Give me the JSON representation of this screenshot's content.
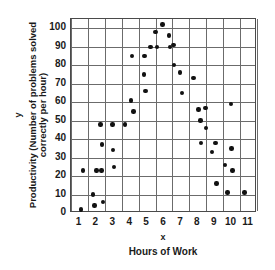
{
  "chart_data": {
    "type": "scatter",
    "title": "",
    "xlabel": "Hours of Work",
    "ylabel": "Productivity (Number of problems solved correctly per hour)",
    "x_axis_variable": "x",
    "y_axis_variable": "y",
    "xlim": [
      0.5,
      11.5
    ],
    "ylim": [
      0,
      105
    ],
    "xticks": [
      1,
      2,
      3,
      4,
      5,
      6,
      7,
      8,
      9,
      10,
      11
    ],
    "yticks": [
      0,
      10,
      20,
      30,
      40,
      50,
      60,
      70,
      80,
      90,
      100
    ],
    "grid": true,
    "legend": "none",
    "marker": "filled-circle",
    "marker_color": "#111111",
    "points": [
      [
        1.1,
        2
      ],
      [
        1.2,
        23
      ],
      [
        1.8,
        10
      ],
      [
        1.9,
        4
      ],
      [
        2.0,
        23
      ],
      [
        2.25,
        48
      ],
      [
        2.3,
        23
      ],
      [
        2.35,
        37
      ],
      [
        2.4,
        6
      ],
      [
        2.95,
        48
      ],
      [
        3.0,
        34
      ],
      [
        3.05,
        25
      ],
      [
        3.7,
        48
      ],
      [
        4.05,
        61
      ],
      [
        4.1,
        85
      ],
      [
        4.2,
        55
      ],
      [
        4.8,
        75
      ],
      [
        4.85,
        85
      ],
      [
        4.9,
        66
      ],
      [
        5.2,
        90
      ],
      [
        5.5,
        98
      ],
      [
        5.6,
        90
      ],
      [
        5.9,
        102
      ],
      [
        6.3,
        96
      ],
      [
        6.35,
        90
      ],
      [
        6.55,
        91
      ],
      [
        6.6,
        80
      ],
      [
        6.95,
        76
      ],
      [
        7.05,
        65
      ],
      [
        7.75,
        73
      ],
      [
        8.05,
        56
      ],
      [
        8.15,
        50
      ],
      [
        8.2,
        38
      ],
      [
        8.45,
        57
      ],
      [
        8.5,
        46
      ],
      [
        8.85,
        33
      ],
      [
        9.05,
        38
      ],
      [
        9.1,
        16
      ],
      [
        9.6,
        26
      ],
      [
        9.75,
        11
      ],
      [
        9.95,
        59
      ],
      [
        10.0,
        35
      ],
      [
        10.05,
        23
      ],
      [
        10.75,
        11
      ]
    ]
  }
}
